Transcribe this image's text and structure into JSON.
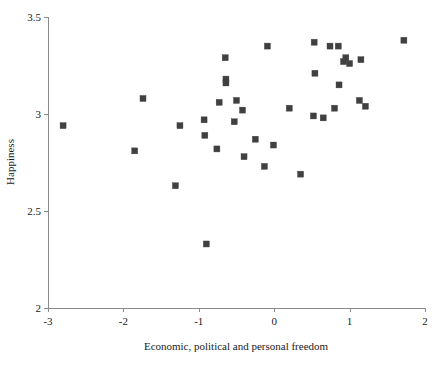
{
  "chart_data": {
    "type": "scatter",
    "title": "",
    "xlabel": "Economic, political and personal freedom",
    "ylabel": "Happiness",
    "xlim": [
      -3,
      2
    ],
    "ylim": [
      2,
      3.5
    ],
    "xticks": [
      "-3",
      "-2",
      "-1",
      "0",
      "1",
      "2"
    ],
    "xtick_values": [
      -3,
      -2,
      -1,
      0,
      1,
      2
    ],
    "yticks": [
      "2",
      "2.5",
      "3",
      "3.5"
    ],
    "ytick_values": [
      2,
      2.5,
      3,
      3.5
    ],
    "grid": false,
    "legend": null,
    "marker": "square",
    "marker_color": "#404040",
    "axis_color": "#8a8a8a",
    "series": [
      {
        "name": "countries",
        "points": [
          [
            -2.8,
            2.94
          ],
          [
            -1.85,
            2.81
          ],
          [
            -1.74,
            3.08
          ],
          [
            -1.31,
            2.63
          ],
          [
            -1.25,
            2.94
          ],
          [
            -0.93,
            2.97
          ],
          [
            -0.9,
            2.33
          ],
          [
            -0.92,
            2.89
          ],
          [
            -0.76,
            2.82
          ],
          [
            -0.73,
            3.06
          ],
          [
            -0.65,
            3.29
          ],
          [
            -0.64,
            3.18
          ],
          [
            -0.64,
            3.16
          ],
          [
            -0.53,
            2.96
          ],
          [
            -0.5,
            3.07
          ],
          [
            -0.42,
            3.02
          ],
          [
            -0.4,
            2.78
          ],
          [
            -0.25,
            2.87
          ],
          [
            -0.13,
            2.73
          ],
          [
            -0.09,
            3.35
          ],
          [
            -0.01,
            2.84
          ],
          [
            0.2,
            3.03
          ],
          [
            0.35,
            2.69
          ],
          [
            0.52,
            2.99
          ],
          [
            0.53,
            3.37
          ],
          [
            0.54,
            3.21
          ],
          [
            0.65,
            2.98
          ],
          [
            0.74,
            3.35
          ],
          [
            0.8,
            3.03
          ],
          [
            0.85,
            3.35
          ],
          [
            0.86,
            3.15
          ],
          [
            0.92,
            3.27
          ],
          [
            0.95,
            3.29
          ],
          [
            1.0,
            3.26
          ],
          [
            1.13,
            3.07
          ],
          [
            1.15,
            3.28
          ],
          [
            1.21,
            3.04
          ],
          [
            1.72,
            3.38
          ]
        ]
      }
    ]
  },
  "axes": {
    "x_axis_name": "x-axis",
    "y_axis_name": "y-axis"
  }
}
